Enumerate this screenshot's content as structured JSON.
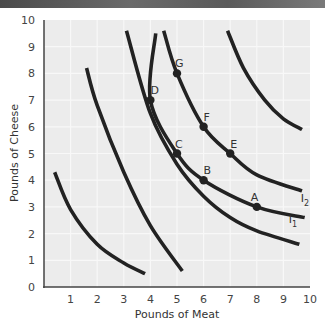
{
  "chart_data": {
    "type": "line",
    "title": "",
    "xlabel": "Pounds of Meat",
    "ylabel": "Pounds of Cheese",
    "xlim": [
      0,
      10
    ],
    "ylim": [
      0,
      10
    ],
    "grid": true,
    "x_ticks": [
      "1",
      "2",
      "3",
      "4",
      "5",
      "6",
      "7",
      "8",
      "9",
      "10"
    ],
    "y_ticks": [
      "0",
      "1",
      "2",
      "3",
      "4",
      "5",
      "6",
      "7",
      "8",
      "9",
      "10"
    ],
    "series": [
      {
        "name": "curve-1",
        "label": "",
        "points": [
          [
            0.4,
            4.3
          ],
          [
            1,
            2.9
          ],
          [
            2,
            1.6
          ],
          [
            3,
            0.9
          ],
          [
            3.8,
            0.5
          ]
        ]
      },
      {
        "name": "curve-2",
        "label": "",
        "points": [
          [
            1.6,
            8.2
          ],
          [
            2,
            6.8
          ],
          [
            3,
            4.3
          ],
          [
            4,
            2.3
          ],
          [
            5.2,
            0.6
          ]
        ]
      },
      {
        "name": "curve-3",
        "label": "",
        "points": [
          [
            3.1,
            9.6
          ],
          [
            4,
            6.5
          ],
          [
            5,
            4.6
          ],
          [
            6,
            3.4
          ],
          [
            7,
            2.6
          ],
          [
            8,
            2.1
          ],
          [
            9.6,
            1.6
          ]
        ]
      },
      {
        "name": "I1",
        "label": "I1",
        "points": [
          [
            4.2,
            9.5
          ],
          [
            4,
            7
          ],
          [
            5,
            5
          ],
          [
            6,
            4
          ],
          [
            8,
            3
          ],
          [
            9.8,
            2.6
          ]
        ]
      },
      {
        "name": "I2",
        "label": "I2",
        "points": [
          [
            4.5,
            9.6
          ],
          [
            5,
            8
          ],
          [
            6,
            6
          ],
          [
            7,
            5
          ],
          [
            8,
            4.2
          ],
          [
            9.7,
            3.6
          ]
        ]
      },
      {
        "name": "curve-6",
        "label": "",
        "points": [
          [
            6.9,
            9.6
          ],
          [
            7.5,
            8.2
          ],
          [
            8.3,
            7
          ],
          [
            9,
            6.3
          ],
          [
            9.7,
            5.9
          ]
        ]
      }
    ],
    "labeled_points": [
      {
        "label": "A",
        "x": 8,
        "y": 3,
        "curve": "I1"
      },
      {
        "label": "B",
        "x": 6,
        "y": 4,
        "curve": "I1"
      },
      {
        "label": "C",
        "x": 5,
        "y": 5,
        "curve": "I1"
      },
      {
        "label": "D",
        "x": 4,
        "y": 7,
        "curve": "I1"
      },
      {
        "label": "E",
        "x": 7,
        "y": 5,
        "curve": "I2"
      },
      {
        "label": "F",
        "x": 6,
        "y": 6,
        "curve": "I2"
      },
      {
        "label": "G",
        "x": 5,
        "y": 8,
        "curve": "I2"
      }
    ],
    "curve_labels": [
      {
        "text": "I",
        "sub": "2",
        "x": 9.65,
        "y": 3.2
      },
      {
        "text": "I",
        "sub": "1",
        "x": 9.2,
        "y": 2.4
      }
    ]
  },
  "colors": {
    "plot_bg": "#ececec",
    "grid": "#f8f8f8",
    "curve": "#222222",
    "axis": "#444444"
  }
}
